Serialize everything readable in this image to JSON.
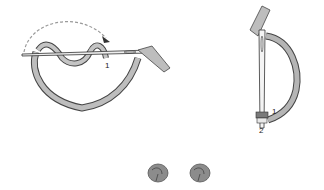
{
  "figure": {
    "left_step": {
      "label_1": "1"
    },
    "right_step": {
      "label_1": "1",
      "label_2": "2"
    },
    "result": {
      "count": 2
    }
  },
  "colors": {
    "ribbon_fill": "#bdbdbd",
    "ribbon_dark": "#8a8a8a",
    "outline": "#444444",
    "arrow": "#9a9a9a",
    "knot": "#8c8c8c"
  }
}
